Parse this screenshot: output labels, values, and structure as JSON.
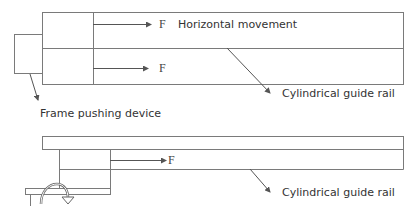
{
  "diagram": {
    "labels": {
      "force_top_1": "F",
      "force_top_2": "F",
      "force_bottom": "F",
      "horizontal_movement": "Horizontal movement",
      "guide_rail_top": "Cylindrical guide rail",
      "frame_pushing_device": "Frame pushing device",
      "guide_rail_bottom": "Cylindrical guide rail"
    },
    "colors": {
      "stroke": "#7a7a7a",
      "arrow": "#555555",
      "text": "#333333"
    },
    "icons": {
      "force_arrow": "arrow-right-icon",
      "leader_arrow": "arrow-diagonal-icon",
      "rotation": "rotate-arrow-icon"
    }
  }
}
